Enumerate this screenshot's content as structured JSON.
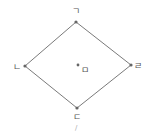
{
  "diagram": {
    "type": "rhombus",
    "colors": {
      "line": "#7a7a7a",
      "point": "#666666",
      "label": "#555555"
    },
    "vertices": [
      {
        "id": "top",
        "label": "ㄱ",
        "x": 76,
        "y": 22,
        "lx": 72,
        "ly": 14
      },
      {
        "id": "left",
        "label": "ㄴ",
        "x": 25,
        "y": 66,
        "lx": 13,
        "ly": 70
      },
      {
        "id": "bottom",
        "label": "ㄷ",
        "x": 77,
        "y": 108,
        "lx": 73,
        "ly": 120
      },
      {
        "id": "right",
        "label": "ㄹ",
        "x": 131,
        "y": 65,
        "lx": 134,
        "ly": 69
      }
    ],
    "center": {
      "id": "center",
      "label": "ㅁ",
      "x": 78,
      "y": 65,
      "lx": 81,
      "ly": 73
    },
    "mark": {
      "label": "/",
      "x": 75,
      "y": 130
    }
  }
}
